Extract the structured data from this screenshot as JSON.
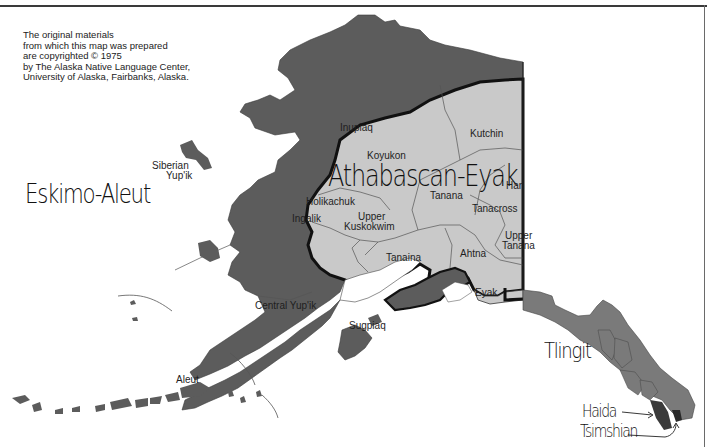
{
  "map": {
    "title": "Alaska Native Languages",
    "copyright_lines": [
      "The original materials",
      "from which this map was prepared",
      "are copyrighted © 1975",
      "by The Alaska Native Language Center,",
      "University of Alaska, Fairbanks, Alaska."
    ],
    "families": {
      "eskimo_aleut": "Eskimo-Aleut",
      "athabascan_eyak": "Athabascan-Eyak",
      "tlingit": "Tlingit",
      "haida": "Haida",
      "tsimshian": "Tsimshian"
    },
    "languages": {
      "inupiaq": "Inupiaq",
      "siberian_yupik_1": "Siberian",
      "siberian_yupik_2": "Yup'ik",
      "central_yupik": "Central Yup'ik",
      "sugpiaq": "Sugpiaq",
      "aleut": "Aleut",
      "koyukon": "Koyukon",
      "kutchin": "Kutchin",
      "holikachuk": "Holikachuk",
      "ingalik": "Ingalik",
      "upper_kuskokwim_1": "Upper",
      "upper_kuskokwim_2": "Kuskokwim",
      "tanana": "Tanana",
      "han": "Han",
      "tanacross": "Tanacross",
      "upper_tanana_1": "Upper",
      "upper_tanana_2": "Tanana",
      "tanaina": "Tanaina",
      "ahtna": "Ahtna",
      "eyak": "Eyak"
    },
    "colors": {
      "eskimo_aleut_fill": "#5c5c5c",
      "athabascan_fill": "#c9c9c9",
      "tlingit_fill": "#7a7a7a",
      "haida_fill": "#3a3a3a",
      "border": "#111111",
      "background": "#ffffff"
    }
  }
}
